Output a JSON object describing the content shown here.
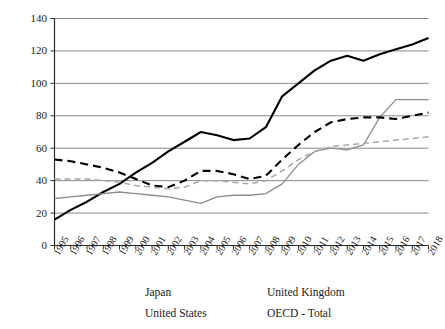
{
  "chart_data": {
    "type": "line",
    "title": "",
    "subtitle": "",
    "xlabel": "",
    "ylabel": "",
    "xlim": [
      1995,
      2018
    ],
    "ylim": [
      0,
      140
    ],
    "ytick_step": 20,
    "grid": true,
    "legend_position": "bottom",
    "x": [
      1995,
      1996,
      1997,
      1998,
      1999,
      2000,
      2001,
      2002,
      2003,
      2004,
      2005,
      2006,
      2007,
      2008,
      2009,
      2010,
      2011,
      2012,
      2013,
      2014,
      2015,
      2016,
      2017,
      2018
    ],
    "categories": [
      "1995",
      "1996",
      "1997",
      "1998",
      "1999",
      "2000",
      "2001",
      "2002",
      "2003",
      "2004",
      "2005",
      "2006",
      "2007",
      "2008",
      "2009",
      "2010",
      "2011",
      "2012",
      "2013",
      "2014",
      "2015",
      "2016",
      "2017",
      "2018"
    ],
    "yticks": [
      0,
      20,
      40,
      60,
      80,
      100,
      120,
      140
    ],
    "series": [
      {
        "name": "Japan",
        "color": "#000000",
        "style": "solid",
        "width": 2.1,
        "values": [
          16,
          22,
          27,
          33,
          38,
          45,
          51,
          58,
          64,
          70,
          68,
          65,
          66,
          73,
          92,
          100,
          108,
          114,
          117,
          114,
          118,
          121,
          124,
          128
        ]
      },
      {
        "name": "United Kingdom",
        "color": "#8c8c8c",
        "style": "solid",
        "width": 1.3,
        "values": [
          29,
          30,
          31,
          32,
          33,
          32,
          31,
          30,
          28,
          26,
          30,
          31,
          31,
          32,
          38,
          50,
          58,
          60,
          59,
          62,
          79,
          90,
          90,
          90
        ]
      },
      {
        "name": "United States",
        "color": "#000000",
        "style": "dashed",
        "width": 2.1,
        "values": [
          53,
          52,
          50,
          48,
          45,
          41,
          37,
          36,
          40,
          46,
          46,
          44,
          41,
          43,
          53,
          62,
          70,
          76,
          78,
          79,
          79,
          78,
          80,
          82
        ]
      },
      {
        "name": "OECD - Total",
        "color": "#a8a8a8",
        "style": "dashed",
        "width": 1.5,
        "values": [
          41,
          41,
          41,
          40,
          39,
          37,
          36,
          35,
          36,
          40,
          40,
          39,
          38,
          40,
          46,
          53,
          58,
          61,
          62,
          63,
          64,
          65,
          66,
          67
        ]
      }
    ]
  },
  "legend": {
    "items": [
      {
        "label": "Japan"
      },
      {
        "label": "United Kingdom"
      },
      {
        "label": "United States"
      },
      {
        "label": "OECD - Total"
      }
    ]
  },
  "colors": {
    "axis": "#2b2b2b",
    "grid": "#8a8a8a",
    "japan": "#000000",
    "united_kingdom": "#8c8c8c",
    "united_states": "#000000",
    "oecd_total": "#a8a8a8",
    "background": "#ffffff"
  }
}
